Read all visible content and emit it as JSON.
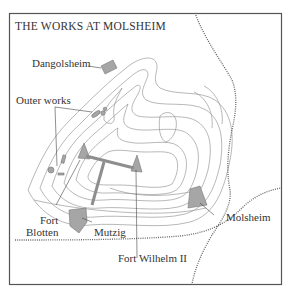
{
  "map": {
    "title": "THE WORKS AT MOLSHEIM",
    "labels": {
      "dangolsheim": "Dangolsheim",
      "outer_works": "Outer works",
      "fort_blotten_1": "Fort",
      "fort_blotten_2": "Blotten",
      "mutzig": "Mutzig",
      "molsheim": "Molsheim",
      "fort_wilhelm": "Fort Wilhelm II"
    },
    "colors": {
      "frame": "#555555",
      "contour": "#9a9a9a",
      "fortification_fill": "#a6a6a6",
      "road": "#666666",
      "text": "#333333"
    },
    "features": {
      "settlements": [
        "Dangolsheim",
        "Mutzig",
        "Molsheim"
      ],
      "forts": [
        "Fort Blotten",
        "Fort Wilhelm II"
      ],
      "other": [
        "Outer works",
        "contour lines",
        "dotted roads/railways"
      ]
    }
  }
}
